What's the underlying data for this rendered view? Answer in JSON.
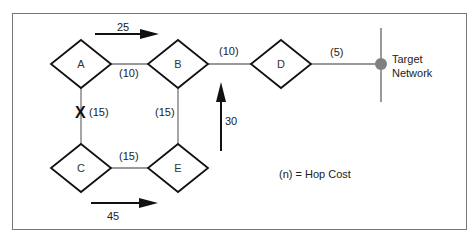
{
  "diagram": {
    "nodes": [
      {
        "id": "A",
        "label": "A"
      },
      {
        "id": "B",
        "label": "B"
      },
      {
        "id": "C",
        "label": "C"
      },
      {
        "id": "D",
        "label": "D"
      },
      {
        "id": "E",
        "label": "E"
      }
    ],
    "target": {
      "label_line1": "Target",
      "label_line2": "Network"
    },
    "links": [
      {
        "from": "A",
        "to": "B",
        "cost": "(10)"
      },
      {
        "from": "B",
        "to": "D",
        "cost": "(10)"
      },
      {
        "from": "D",
        "to": "Target",
        "cost": "(5)"
      },
      {
        "from": "A",
        "to": "C",
        "cost": "(15)",
        "broken": true,
        "break_mark": "X"
      },
      {
        "from": "B",
        "to": "E",
        "cost": "(15)"
      },
      {
        "from": "C",
        "to": "E",
        "cost": "(15)"
      }
    ],
    "flows": [
      {
        "value": "25",
        "direction": "right"
      },
      {
        "value": "30",
        "direction": "up"
      },
      {
        "value": "45",
        "direction": "right"
      }
    ],
    "legend": "(n) = Hop Cost"
  }
}
